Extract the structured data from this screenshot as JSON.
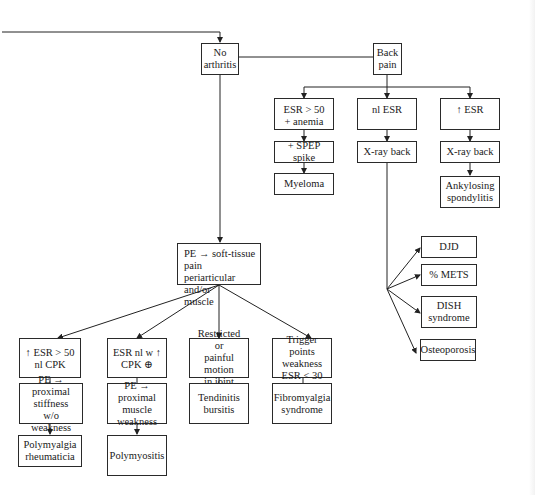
{
  "diagram": {
    "type": "flowchart",
    "nodes": {
      "no_arthritis": "No\narthritis",
      "back_pain": "Back\npain",
      "esr_anemia": "ESR > 50\n+ anemia",
      "nl_esr": "nl ESR",
      "up_esr": "↑ ESR",
      "spep_spike": "+ SPEP spike",
      "xray_back_1": "X-ray back",
      "xray_back_2": "X-ray back",
      "myeloma": "Myeloma",
      "ankylosing": "Ankylosing\nspondylitis",
      "djd": "DJD",
      "mets": "% METS",
      "dish": "DISH\nsyndrome",
      "osteoporosis": "Osteoporosis",
      "pe_soft_tissue": "PE → soft-tissue pain\nperiarticular and/or\nmuscle",
      "esr_gt50_nl_cpk": "↑ ESR > 50\nnl CPK",
      "esr_nl_cpk_pos": "ESR nl w ↑\nCPK ⊕",
      "restricted_motion": "Restricted or\npainful motion\nin joint",
      "trigger_points": "Trigger points\nweakness\nESR < 30",
      "pe_prox_stiffness": "PE → proximal\nstiffness\nw/o weakness",
      "pe_prox_weakness": "PE → proximal\nmuscle\nweakness",
      "tendinitis": "Tendinitis\nbursitis",
      "fibromyalgia": "Fibromyalgia\nsyndrome",
      "polymyalgia": "Polymyalgia\nrheumaticia",
      "polymyositis": "Polymyositis"
    },
    "edges": [
      [
        "incoming",
        "no_arthritis"
      ],
      [
        "no_arthritis",
        "back_pain"
      ],
      [
        "back_pain",
        "esr_anemia"
      ],
      [
        "back_pain",
        "nl_esr"
      ],
      [
        "back_pain",
        "up_esr"
      ],
      [
        "esr_anemia",
        "spep_spike"
      ],
      [
        "spep_spike",
        "myeloma"
      ],
      [
        "nl_esr",
        "xray_back_1"
      ],
      [
        "up_esr",
        "xray_back_2"
      ],
      [
        "xray_back_2",
        "ankylosing"
      ],
      [
        "xray_back_1",
        "djd"
      ],
      [
        "xray_back_1",
        "mets"
      ],
      [
        "xray_back_1",
        "dish"
      ],
      [
        "xray_back_1",
        "osteoporosis"
      ],
      [
        "no_arthritis",
        "pe_soft_tissue"
      ],
      [
        "pe_soft_tissue",
        "esr_gt50_nl_cpk"
      ],
      [
        "pe_soft_tissue",
        "esr_nl_cpk_pos"
      ],
      [
        "pe_soft_tissue",
        "restricted_motion"
      ],
      [
        "pe_soft_tissue",
        "trigger_points"
      ],
      [
        "esr_gt50_nl_cpk",
        "pe_prox_stiffness"
      ],
      [
        "pe_prox_stiffness",
        "polymyalgia"
      ],
      [
        "esr_nl_cpk_pos",
        "pe_prox_weakness"
      ],
      [
        "pe_prox_weakness",
        "polymyositis"
      ],
      [
        "restricted_motion",
        "tendinitis"
      ],
      [
        "trigger_points",
        "fibromyalgia"
      ]
    ]
  }
}
